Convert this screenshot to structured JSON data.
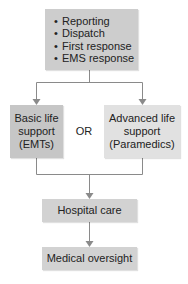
{
  "diagram": {
    "type": "flowchart",
    "top_box": {
      "items": [
        "Reporting",
        "Dispatch",
        "First response",
        "EMS response"
      ],
      "bullet": "•",
      "color": "#cdcdcd"
    },
    "branch_left": {
      "lines": [
        "Basic life",
        "support",
        "(EMTs)"
      ],
      "color": "#c6c6c6"
    },
    "branch_connector": "OR",
    "branch_right": {
      "lines": [
        "Advanced life",
        "support",
        "(Paramedics)"
      ],
      "color": "#e1e1e1"
    },
    "hospital_box": {
      "label": "Hospital care",
      "color": "#d2d2d2"
    },
    "oversight_box": {
      "label": "Medical oversight",
      "color": "#d2d2d2"
    },
    "connector_color": "#8a8a8a"
  }
}
